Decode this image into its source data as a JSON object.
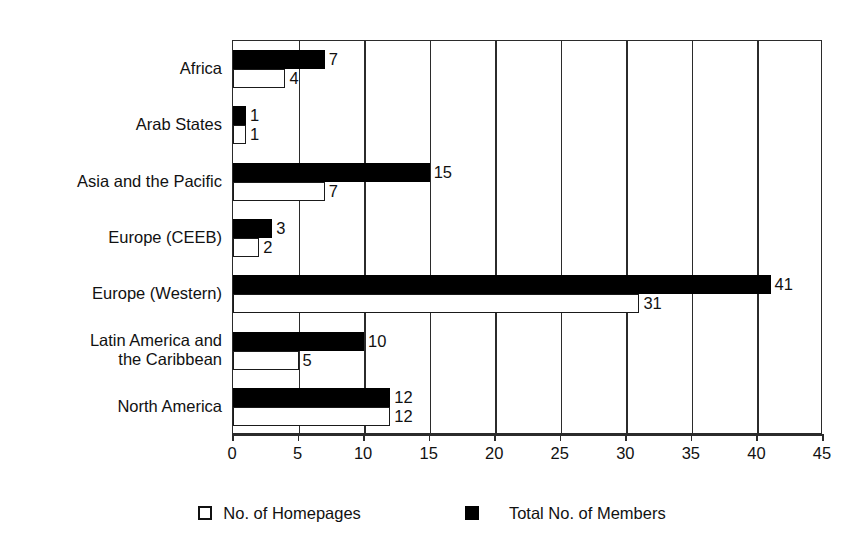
{
  "chart_data": {
    "type": "bar",
    "orientation": "horizontal",
    "title": "",
    "xlabel": "",
    "ylabel": "",
    "xlim": [
      0,
      45
    ],
    "xticks": [
      0,
      5,
      10,
      15,
      20,
      25,
      30,
      35,
      40,
      45
    ],
    "xtick_labels": [
      "0",
      "5",
      "10",
      "15",
      "20",
      "25",
      "30",
      "35",
      "40",
      "45"
    ],
    "grid": true,
    "grid_axis": "x",
    "legend_position": "bottom",
    "categories": [
      "Africa",
      "Arab States",
      "Asia and the Pacific",
      "Europe (CEEB)",
      "Europe (Western)",
      "Latin America and\nthe Caribbean",
      "North America"
    ],
    "series": [
      {
        "name": "Total No. of Members",
        "color": "#000000",
        "style": "filled",
        "values": [
          7,
          1,
          15,
          3,
          41,
          10,
          12
        ]
      },
      {
        "name": "No. of Homepages",
        "color": "#ffffff",
        "style": "outlined",
        "values": [
          4,
          1,
          7,
          2,
          31,
          5,
          12
        ]
      }
    ]
  },
  "legend": {
    "items": [
      {
        "label": "No. of Homepages",
        "swatch": "open-square-swatch"
      },
      {
        "label": "Total No. of Members",
        "swatch": "filled-square-swatch"
      }
    ]
  }
}
